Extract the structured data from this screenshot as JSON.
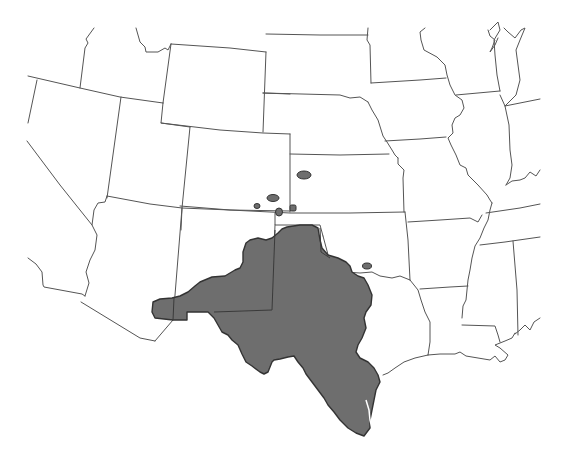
{
  "map": {
    "title": "Species range map, south-central United States",
    "region": "Western and central United States",
    "colors": {
      "background": "#ffffff",
      "state_border": "#555555",
      "range_fill": "#6e6e6e",
      "range_outline": "#333333"
    },
    "range": {
      "label": "Distribution range",
      "states_covered": [
        "Texas",
        "New Mexico",
        "Oklahoma"
      ],
      "main_area": "Western and central Texas, southeastern New Mexico, western Oklahoma",
      "disjunct_populations": [
        {
          "location": "Southwestern Kansas",
          "count": 1
        },
        {
          "location": "Southeastern Colorado",
          "count": 3
        },
        {
          "location": "Oklahoma panhandle border",
          "count": 1
        },
        {
          "location": "South-central Oklahoma",
          "count": 1
        }
      ]
    },
    "states_visible": [
      "California",
      "Nevada",
      "Oregon",
      "Idaho",
      "Utah",
      "Arizona",
      "Wyoming",
      "Colorado",
      "New Mexico",
      "South Dakota",
      "Nebraska",
      "Kansas",
      "Oklahoma",
      "Texas",
      "Minnesota",
      "Iowa",
      "Missouri",
      "Arkansas",
      "Louisiana",
      "Wisconsin",
      "Illinois",
      "Mississippi",
      "Alabama",
      "Indiana",
      "Kentucky",
      "Tennessee",
      "Michigan"
    ]
  }
}
